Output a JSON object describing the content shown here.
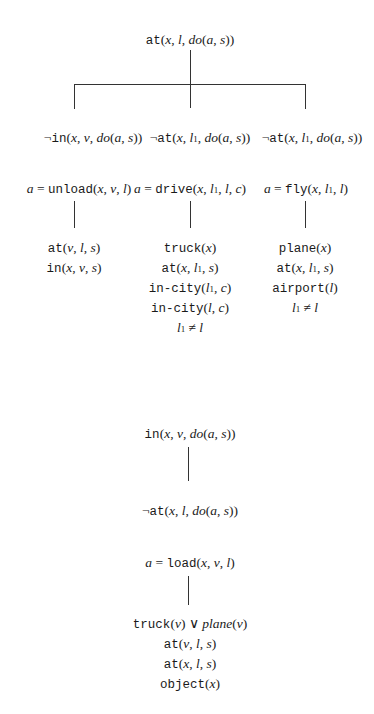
{
  "diagram1": {
    "root": "at(x, l, do(a, s))",
    "branches": [
      {
        "effect": "¬in(x, v, do(a, s))",
        "action": "a = unload(x, v, l)",
        "conditions": [
          "at(v, l, s)",
          "in(x, v, s)"
        ]
      },
      {
        "effect": "¬at(x, l₁, do(a, s))",
        "action": "a = drive(x, l₁, l, c)",
        "conditions": [
          "truck(x)",
          "at(x, l₁, s)",
          "in-city(l₁, c)",
          "in-city(l, c)",
          "l₁ ≠ l"
        ]
      },
      {
        "effect": "¬at(x, l₁, do(a, s))",
        "action": "a = fly(x, l₁, l)",
        "conditions": [
          "plane(x)",
          "at(x, l₁, s)",
          "airport(l)",
          "l₁ ≠ l"
        ]
      }
    ]
  },
  "diagram2": {
    "root": "in(x, v, do(a, s))",
    "effect": "¬at(x, l, do(a, s))",
    "action": "a = load(x, v, l)",
    "conditions": [
      "truck(v) ∨ plane(v)",
      "at(v, l, s)",
      "at(x, l, s)",
      "object(x)"
    ]
  }
}
